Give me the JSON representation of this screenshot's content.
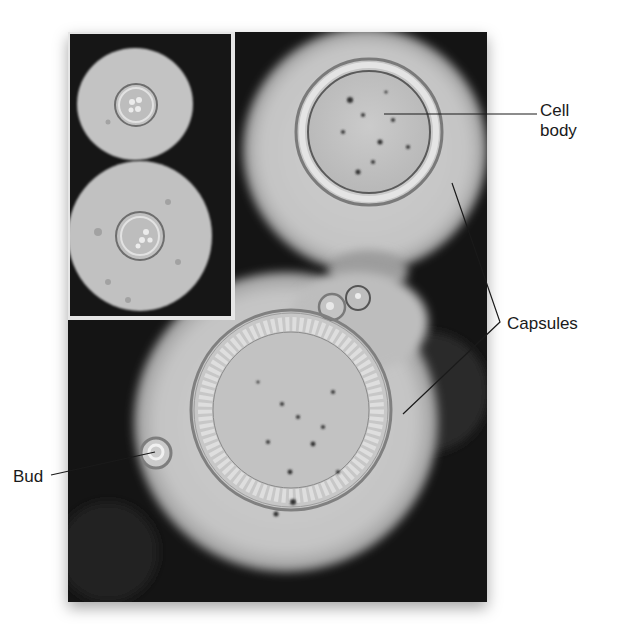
{
  "figure": {
    "labels": {
      "cell_body": "Cell\nbody",
      "cell_body_line1": "Cell",
      "cell_body_line2": "body",
      "capsules": "Capsules",
      "bud": "Bud"
    },
    "colors": {
      "background_ink": "#161616",
      "capsule": "#c9c9c9",
      "cell_wall": "#8a8a8a",
      "label_text": "#1a1a1a",
      "inset_border": "#e6e6e6"
    }
  }
}
